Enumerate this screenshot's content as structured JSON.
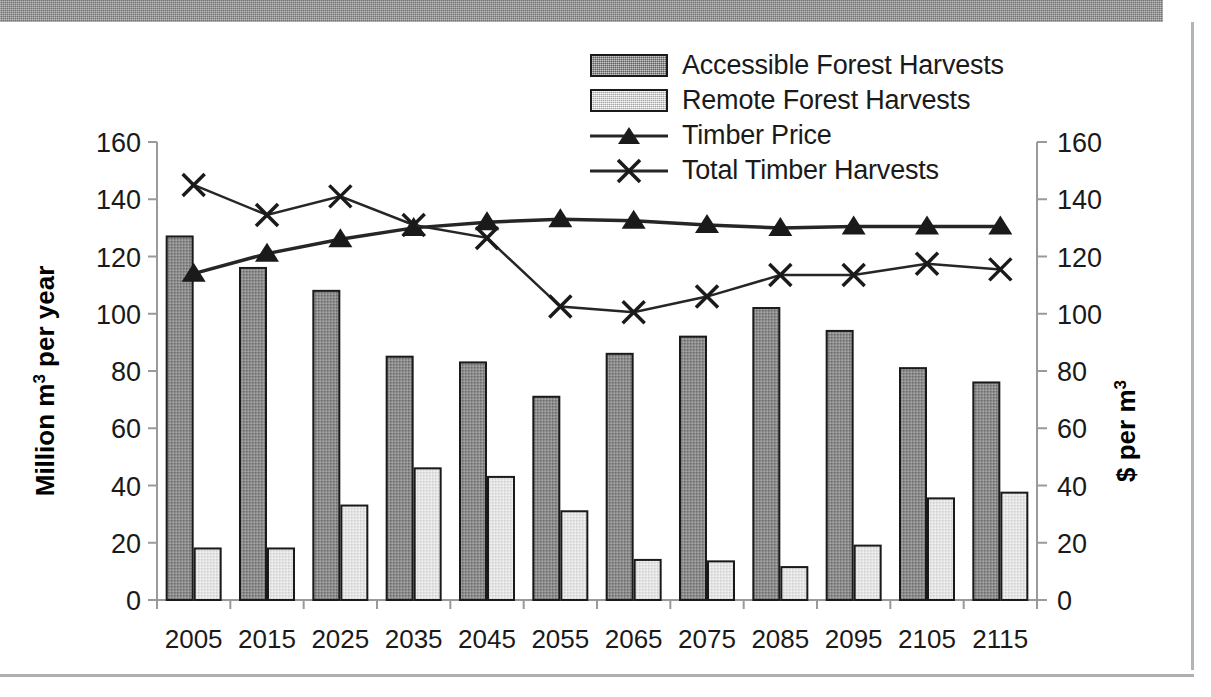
{
  "chart_data": {
    "type": "bar",
    "title": "",
    "xlabel": "Year",
    "ylabel": "Million m3 per year",
    "ylabel_main": "Million m",
    "ylabel_sup": "3",
    "ylabel_tail": " per year",
    "y2label": "$ per m3",
    "y2label_main": "$ per m",
    "y2label_sup": "3",
    "ylim": [
      0,
      160
    ],
    "y2lim": [
      0,
      160
    ],
    "yticks": [
      0,
      20,
      40,
      60,
      80,
      100,
      120,
      140,
      160
    ],
    "y2ticks": [
      0,
      20,
      40,
      60,
      80,
      100,
      120,
      140,
      160
    ],
    "grid": false,
    "legend_position": "top-center",
    "categories": [
      "2005",
      "2015",
      "2025",
      "2035",
      "2045",
      "2055",
      "2065",
      "2075",
      "2085",
      "2095",
      "2105",
      "2115"
    ],
    "series": [
      {
        "name": "Accessible Forest Harvests",
        "type": "bar",
        "axis": "left",
        "values": [
          127,
          116,
          108,
          85,
          83,
          71,
          86,
          92,
          102,
          94,
          81,
          76
        ]
      },
      {
        "name": "Remote Forest Harvests",
        "type": "bar",
        "axis": "left",
        "values": [
          18,
          18,
          33,
          46,
          43,
          31,
          14,
          13.5,
          11.5,
          19,
          35.5,
          37.5
        ]
      },
      {
        "name": "Timber Price",
        "type": "line",
        "axis": "right",
        "marker": "triangle",
        "values": [
          114,
          121,
          126,
          130,
          132,
          133,
          132.5,
          131,
          130,
          130.5,
          130.5,
          130.5
        ]
      },
      {
        "name": "Total Timber Harvests",
        "type": "line",
        "axis": "left",
        "marker": "x",
        "values": [
          145,
          134.5,
          141,
          131,
          126.5,
          102.5,
          100.5,
          106,
          113.5,
          113.5,
          117.5,
          115.5
        ]
      }
    ]
  },
  "legend": {
    "items": [
      {
        "label": "Accessible Forest Harvests",
        "key": "swatch-dark"
      },
      {
        "label": "Remote Forest Harvests",
        "key": "swatch-light"
      },
      {
        "label": "Timber Price",
        "key": "line-triangle"
      },
      {
        "label": "Total Timber Harvests",
        "key": "line-x"
      }
    ]
  },
  "colors": {
    "bar_accessible": "#8c8c8c",
    "bar_remote": "#e2e2e2",
    "line": "#262626",
    "axis": "#9a9a9a",
    "text": "#1a1a1a",
    "frame": "#8e8e8e"
  }
}
